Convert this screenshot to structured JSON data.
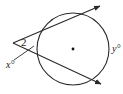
{
  "diagram": {
    "type": "secants-from-external-point",
    "colors": {
      "stroke": "#2a2a2a",
      "background": "#ffffff"
    },
    "circle": {
      "cx": 73,
      "cy": 49,
      "r": 36,
      "center_dot": true
    },
    "vertex": {
      "x": 13,
      "y": 43
    },
    "rays": [
      {
        "name": "upper-secant",
        "to": {
          "x": 100,
          "y": 6
        }
      },
      {
        "name": "lower-secant",
        "to": {
          "x": 101,
          "y": 84
        }
      }
    ],
    "labels": {
      "angle": "2",
      "far_arc": "y°",
      "near_arc": "x°"
    }
  }
}
